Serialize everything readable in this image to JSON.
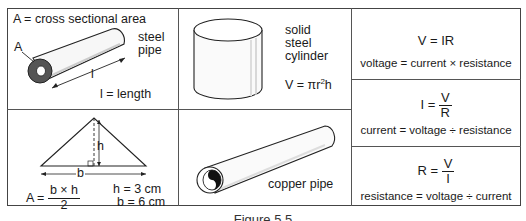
{
  "cells": {
    "steel_pipe": {
      "area_definition": "A = cross sectional area",
      "area_label": "A",
      "name_line1": "steel",
      "name_line2": "pipe",
      "length_label": "l",
      "length_definition": "l = length"
    },
    "triangle": {
      "height_label": "h",
      "base_label": "b",
      "formula_lhs": "A =",
      "formula_numerator": "b × h",
      "formula_denominator": "2",
      "given_h": "h = 3 cm",
      "given_b": "b = 6 cm"
    },
    "cylinder": {
      "name_line1": "solid",
      "name_line2": "steel",
      "name_line3": "cylinder",
      "formula_prefix": "V = πr",
      "formula_exp": "2",
      "formula_suffix": "h"
    },
    "copper_pipe": {
      "name": "copper pipe"
    },
    "ohms_law": [
      {
        "formula": "V = IR",
        "words": "voltage = current × resistance"
      },
      {
        "lhs": "I =",
        "numerator": "V",
        "denominator": "R",
        "words": "current = voltage ÷ resistance"
      },
      {
        "lhs": "R =",
        "numerator": "V",
        "denominator": "I",
        "words": "resistance = voltage ÷ current"
      }
    ]
  },
  "caption": "Figure 5.5"
}
